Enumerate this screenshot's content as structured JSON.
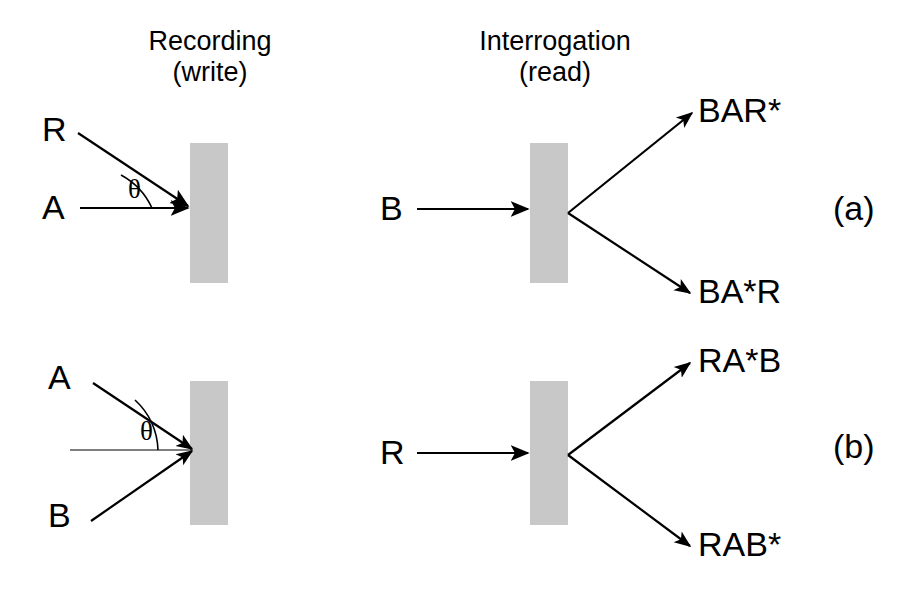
{
  "figure": {
    "width": 916,
    "height": 596,
    "background_color": "#ffffff",
    "ink_color": "#000000",
    "medium_color": "#c8c8c8",
    "caption_note": "Two-panel schematic of holographic recording (write) and interrogation (read) geometries"
  },
  "headers": {
    "recording": {
      "line1": "Recording",
      "line2": "(write)"
    },
    "interrogation": {
      "line1": "Interrogation",
      "line2": "(read)"
    }
  },
  "panels": [
    {
      "id": "a",
      "label": "(a)",
      "recording": {
        "angle_symbol": "θ",
        "beams": [
          {
            "name": "R",
            "label": "R",
            "role": "reference-beam",
            "direction": "oblique-down-right"
          },
          {
            "name": "A",
            "label": "A",
            "role": "signal-beam",
            "direction": "horizontal-right"
          }
        ]
      },
      "interrogation": {
        "input_beams": [
          {
            "name": "B",
            "label": "B",
            "role": "probe-beam",
            "direction": "horizontal-right"
          }
        ],
        "output_beams": [
          {
            "name": "BAR*",
            "label": "BAR*",
            "direction": "up-right"
          },
          {
            "name": "BA*R",
            "label": "BA*R",
            "direction": "down-right"
          }
        ]
      }
    },
    {
      "id": "b",
      "label": "(b)",
      "recording": {
        "angle_symbol": "θ",
        "beams": [
          {
            "name": "A",
            "label": "A",
            "role": "signal-beam",
            "direction": "oblique-down-right"
          },
          {
            "name": "B",
            "label": "B",
            "role": "signal-beam",
            "direction": "oblique-up-right"
          }
        ]
      },
      "interrogation": {
        "input_beams": [
          {
            "name": "R",
            "label": "R",
            "role": "probe-beam",
            "direction": "horizontal-right"
          }
        ],
        "output_beams": [
          {
            "name": "RA*B",
            "label": "RA*B",
            "direction": "up-right"
          },
          {
            "name": "RAB*",
            "label": "RAB*",
            "direction": "down-right"
          }
        ]
      }
    }
  ],
  "geometry": {
    "media_slabs": [
      {
        "name": "panel-a-recording-medium",
        "x": 190,
        "y": 143,
        "w": 38,
        "h": 140
      },
      {
        "name": "panel-a-interrogation-medium",
        "x": 530,
        "y": 143,
        "w": 38,
        "h": 140
      },
      {
        "name": "panel-b-recording-medium",
        "x": 190,
        "y": 381,
        "w": 38,
        "h": 144
      },
      {
        "name": "panel-b-interrogation-medium",
        "x": 530,
        "y": 381,
        "w": 38,
        "h": 144
      }
    ]
  }
}
